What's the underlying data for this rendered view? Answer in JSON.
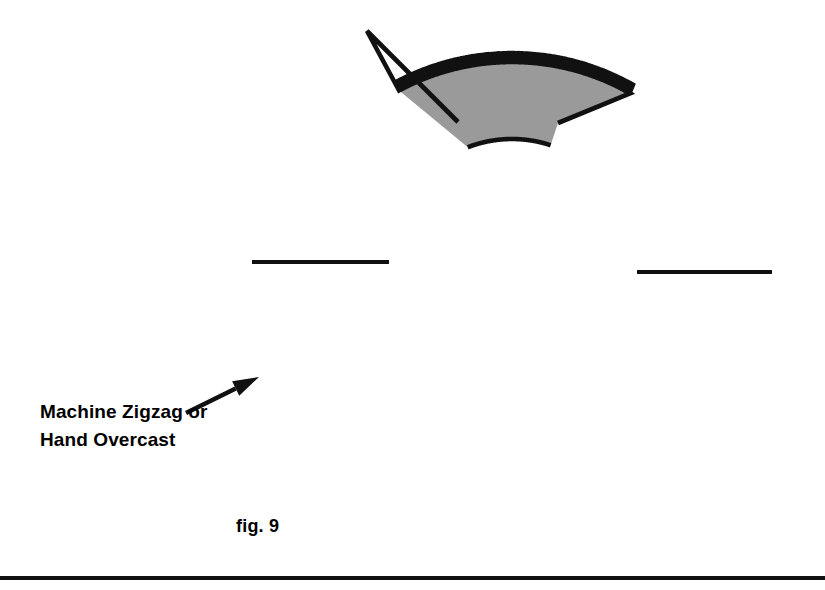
{
  "figure": {
    "caption": "fig. 9",
    "annotation": {
      "line1": "Machine Zigzag or",
      "line2": "Hand Overcast"
    },
    "colors": {
      "fabric_fill": "#9a9a9a",
      "outline": "#111111",
      "background": "#ffffff",
      "rule": "#111111"
    },
    "shape": {
      "name": "horseshoe-collar-pattern-piece",
      "outer_center_x": 512,
      "outer_center_y": 300,
      "outer_radius": 238,
      "inner_center_x": 512,
      "inner_center_y": 262,
      "inner_radius": 123,
      "left_peak_x": 367,
      "left_peak_y": 31,
      "right_peak_x": 665,
      "right_peak_y": 32,
      "left_inner_tip_x": 458,
      "left_inner_tip_y": 122,
      "right_inner_tip_x": 558,
      "right_inner_tip_y": 123
    },
    "seams": [
      {
        "name": "left-shoulder-seam",
        "x1": 252,
        "y1": 262,
        "x2": 389,
        "y2": 262
      },
      {
        "name": "right-shoulder-seam",
        "x1": 637,
        "y1": 272,
        "x2": 772,
        "y2": 272
      }
    ],
    "arrow": {
      "tail_x": 186,
      "tail_y": 413,
      "tip_x": 259,
      "tip_y": 377
    },
    "stitch": {
      "name": "zigzag-overcast-stitch",
      "tooth_height": 11,
      "tooth_count": 96
    }
  }
}
